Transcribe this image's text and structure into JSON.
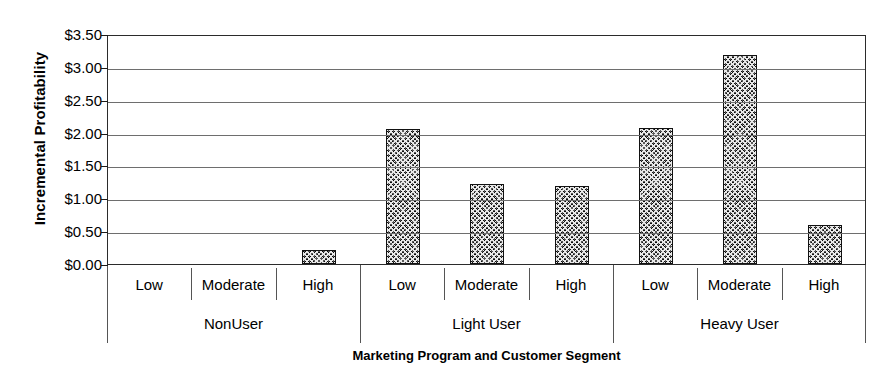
{
  "chart_data": {
    "type": "bar",
    "title": "",
    "xlabel": "Marketing Program and Customer Segment",
    "ylabel": "Incremental Profitability",
    "ylim": [
      0,
      3.5
    ],
    "ytick_values": [
      0,
      0.5,
      1.0,
      1.5,
      2.0,
      2.5,
      3.0,
      3.5
    ],
    "ytick_labels": [
      "$0.00",
      "$0.50",
      "$1.00",
      "$1.50",
      "$2.00",
      "$2.50",
      "$3.00",
      "$3.50"
    ],
    "grid": true,
    "legend": "none",
    "categories": [
      "Low",
      "Moderate",
      "High"
    ],
    "groups": [
      {
        "name": "NonUser",
        "categories": [
          "Low",
          "Moderate",
          "High"
        ],
        "values": [
          0.0,
          0.0,
          0.22
        ]
      },
      {
        "name": "Light User",
        "categories": [
          "Low",
          "Moderate",
          "High"
        ],
        "values": [
          2.05,
          1.22,
          1.18
        ]
      },
      {
        "name": "Heavy User",
        "categories": [
          "Low",
          "Moderate",
          "High"
        ],
        "values": [
          2.07,
          3.18,
          0.6
        ]
      }
    ],
    "values_flat": [
      0.0,
      0.0,
      0.22,
      2.05,
      1.22,
      1.18,
      2.07,
      3.18,
      0.6
    ],
    "bar_fill": "#585858",
    "bar_pattern": "dense-diagonal-crosshatch",
    "bar_edge_color": "#111111",
    "axis_color": "#2b2b2b",
    "grid_color": "#6e6e6e",
    "background": "#ffffff"
  }
}
